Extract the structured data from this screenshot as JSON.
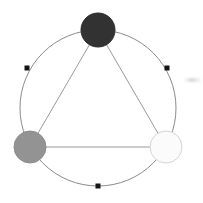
{
  "diagram": {
    "canvas": {
      "width": 203,
      "height": 203,
      "background": "#ffffff"
    },
    "ring": {
      "label": "outer-circle",
      "center_x": 98,
      "center_y": 108,
      "radius": 78,
      "stroke": "#8a8a8a",
      "stroke_width": 1,
      "fill": "none"
    },
    "nodes": [
      {
        "id": "node-top",
        "label": "top-node",
        "cx": 98,
        "cy": 30,
        "r": 17,
        "fill": "#323232",
        "stroke": "#2b2b2b",
        "angle_deg": 90
      },
      {
        "id": "node-left",
        "label": "left-node",
        "cx": 30,
        "cy": 147,
        "r": 16,
        "fill": "#939393",
        "stroke": "#8c8c8c",
        "angle_deg": 210
      },
      {
        "id": "node-right",
        "label": "right-node",
        "cx": 166,
        "cy": 147,
        "r": 16,
        "fill": "#fbfbfb",
        "stroke": "#d4d4d4",
        "angle_deg": 330
      }
    ],
    "edges": [
      {
        "id": "edge-top-left",
        "label": "top-to-left",
        "from": "node-top",
        "to": "node-left",
        "stroke": "#9a9a9a",
        "stroke_width": 1
      },
      {
        "id": "edge-top-right",
        "label": "top-to-right",
        "from": "node-top",
        "to": "node-right",
        "stroke": "#9a9a9a",
        "stroke_width": 1
      },
      {
        "id": "edge-left-right",
        "label": "left-to-right",
        "from": "node-left",
        "to": "node-right",
        "stroke": "#9a9a9a",
        "stroke_width": 1
      }
    ],
    "markers": [
      {
        "id": "marker-upper-left",
        "label": "arc-marker-upper-left",
        "cx": 27,
        "cy": 68,
        "size": 5,
        "fill": "#141414",
        "angle_deg": 150
      },
      {
        "id": "marker-upper-right",
        "label": "arc-marker-upper-right",
        "cx": 167,
        "cy": 68,
        "size": 5,
        "fill": "#141414",
        "angle_deg": 30
      },
      {
        "id": "marker-bottom",
        "label": "arc-marker-bottom",
        "cx": 98,
        "cy": 186,
        "size": 5,
        "fill": "#141414",
        "angle_deg": 270
      }
    ],
    "artifact": {
      "label": "scan-smudge",
      "x": 183,
      "y": 78,
      "width": 18,
      "height": 4,
      "color": "#cfcfcf"
    }
  },
  "chart_data": {
    "type": "scatter",
    "xlabel": "",
    "ylabel": "",
    "xlim": [
      0,
      203
    ],
    "ylim": [
      0,
      203
    ],
    "grid": false,
    "legend": false,
    "series": [
      {
        "name": "nodes",
        "points": [
          {
            "label": "top-node",
            "x": 98,
            "y": 30,
            "size": 17,
            "color": "#323232"
          },
          {
            "label": "left-node",
            "x": 30,
            "y": 147,
            "size": 16,
            "color": "#939393"
          },
          {
            "label": "right-node",
            "x": 166,
            "y": 147,
            "size": 16,
            "color": "#fbfbfb"
          }
        ]
      },
      {
        "name": "arc-markers",
        "points": [
          {
            "label": "arc-marker-upper-left",
            "x": 27,
            "y": 68,
            "size": 2.5,
            "color": "#141414"
          },
          {
            "label": "arc-marker-upper-right",
            "x": 167,
            "y": 68,
            "size": 2.5,
            "color": "#141414"
          },
          {
            "label": "arc-marker-bottom",
            "x": 98,
            "y": 186,
            "size": 2.5,
            "color": "#141414"
          }
        ]
      }
    ],
    "annotations": [
      {
        "label": "outer-circle",
        "shape": "circle",
        "cx": 98,
        "cy": 108,
        "r": 78
      },
      {
        "label": "triangle",
        "shape": "polygon",
        "vertices": [
          [
            98,
            30
          ],
          [
            30,
            147
          ],
          [
            166,
            147
          ]
        ]
      }
    ]
  }
}
